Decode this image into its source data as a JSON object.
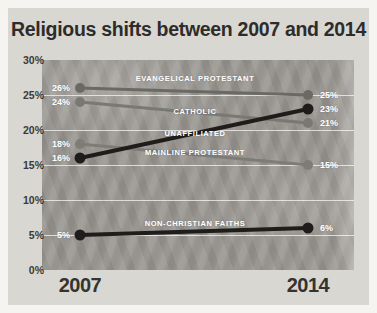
{
  "title": "Religious shifts between 2007 and 2014",
  "chart_data": {
    "type": "line",
    "subtype": "slopegraph",
    "x_labels": [
      "2007",
      "2014"
    ],
    "ylim": [
      0,
      30
    ],
    "yticks": [
      {
        "value": 30,
        "label": "30%"
      },
      {
        "value": 25,
        "label": "25%"
      },
      {
        "value": 20,
        "label": "20%"
      },
      {
        "value": 15,
        "label": "15%"
      },
      {
        "value": 10,
        "label": "10%"
      },
      {
        "value": 5,
        "label": "5%"
      },
      {
        "value": 0,
        "label": "0%"
      }
    ],
    "grid": true,
    "legend_position": "inline-labels",
    "series": [
      {
        "name": "EVANGELICAL PROTESTANT",
        "values": [
          26,
          25
        ],
        "value_labels": [
          "26%",
          "25%"
        ],
        "color": "#6b6964",
        "label_y": 27.4,
        "z": 1
      },
      {
        "name": "CATHOLIC",
        "values": [
          24,
          21
        ],
        "value_labels": [
          "24%",
          "21%"
        ],
        "color": "#7a7872",
        "label_y": 22.7,
        "z": 1
      },
      {
        "name": "UNAFFILIATED",
        "values": [
          16,
          23
        ],
        "value_labels": [
          "16%",
          "23%"
        ],
        "color": "#1e1d1b",
        "label_y": 19.6,
        "z": 3
      },
      {
        "name": "MAINLINE PROTESTANT",
        "values": [
          18,
          15
        ],
        "value_labels": [
          "18%",
          "15%"
        ],
        "color": "#7e7c76",
        "label_y": 16.9,
        "z": 2
      },
      {
        "name": "NON-CHRISTIAN FAITHS",
        "values": [
          5,
          6
        ],
        "value_labels": [
          "5%",
          "6%"
        ],
        "color": "#1e1d1b",
        "label_y": 6.7,
        "z": 2
      }
    ],
    "colors": {
      "card_background": "#d9d7d2",
      "plot_background": "#989590",
      "gridline": "#ffffff",
      "title_text": "#2d2c2a",
      "axis_text": "#3b3a37",
      "series_text": "#ffffff",
      "dark_series": "#1e1d1b",
      "gray_series": "#7a7872"
    }
  }
}
